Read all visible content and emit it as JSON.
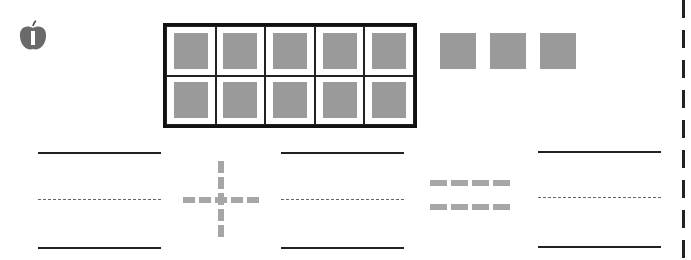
{
  "worksheet": {
    "icon": "apple-icon",
    "ten_frame": {
      "rows": 2,
      "cols": 5,
      "filled": 10
    },
    "extra_counters": 3,
    "equation": {
      "operator": "plus",
      "equals": "equals",
      "blanks": 3
    },
    "colors": {
      "counter": "#9a9a9a",
      "line": "#222222",
      "operator": "#a6a6a6"
    }
  }
}
